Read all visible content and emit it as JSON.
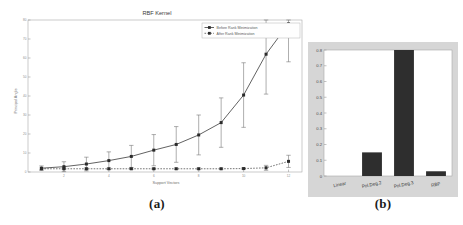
{
  "figure": {
    "panel_a_caption": "(a)",
    "panel_b_caption": "(b)"
  },
  "chart_data": [
    {
      "type": "line",
      "panel": "(a)",
      "title": "RBF Kernel",
      "xlabel": "Support Vectors",
      "ylabel": "Principal Angle",
      "grid": false,
      "legend_position": "top-right",
      "x": [
        1,
        2,
        3,
        4,
        5,
        6,
        7,
        8,
        9,
        10,
        11,
        12
      ],
      "xticks": [
        "2",
        "4",
        "6",
        "8",
        "10",
        "12"
      ],
      "xtick_values": [
        2,
        4,
        6,
        8,
        10,
        12
      ],
      "yticks": [
        "0",
        "10",
        "20",
        "30",
        "40",
        "50",
        "60",
        "70",
        "80"
      ],
      "ytick_values": [
        0,
        10,
        20,
        30,
        40,
        50,
        60,
        70,
        80
      ],
      "xlim": [
        0.4,
        12.6
      ],
      "ylim": [
        0,
        80
      ],
      "series": [
        {
          "name": "Before Rank Minimization",
          "values": [
            2.0,
            2.8,
            4.2,
            6.0,
            8.2,
            11.5,
            14.5,
            19.5,
            26.0,
            40.5,
            62.0,
            78.0
          ],
          "errors": [
            1.2,
            2.6,
            3.6,
            4.6,
            5.8,
            8.2,
            9.4,
            10.5,
            13.0,
            17.0,
            21.0,
            20.0
          ],
          "style": "solid",
          "marker": "square"
        },
        {
          "name": "After Rank Minimization",
          "values": [
            1.7,
            1.7,
            1.7,
            1.7,
            1.7,
            1.7,
            1.7,
            1.7,
            1.7,
            1.8,
            2.2,
            5.6
          ],
          "errors": [
            0.4,
            0.4,
            0.4,
            0.4,
            0.4,
            0.4,
            0.4,
            0.4,
            0.4,
            0.5,
            1.3,
            3.2
          ],
          "style": "dotted",
          "marker": "square"
        }
      ]
    },
    {
      "type": "bar",
      "panel": "(b)",
      "title": "",
      "xlabel": "",
      "ylabel": "",
      "grid": false,
      "categories": [
        "Linear",
        "Pol.Deg.2",
        "Pol.Deg.3",
        "RBF"
      ],
      "values": [
        0.0,
        0.15,
        0.8,
        0.03
      ],
      "yticks": [
        "0",
        "0.1",
        "0.2",
        "0.3",
        "0.4",
        "0.5",
        "0.6",
        "0.7",
        "0.8"
      ],
      "ytick_values": [
        0,
        0.1,
        0.2,
        0.3,
        0.4,
        0.5,
        0.6,
        0.7,
        0.8
      ],
      "ylim": [
        0,
        0.8
      ]
    }
  ]
}
